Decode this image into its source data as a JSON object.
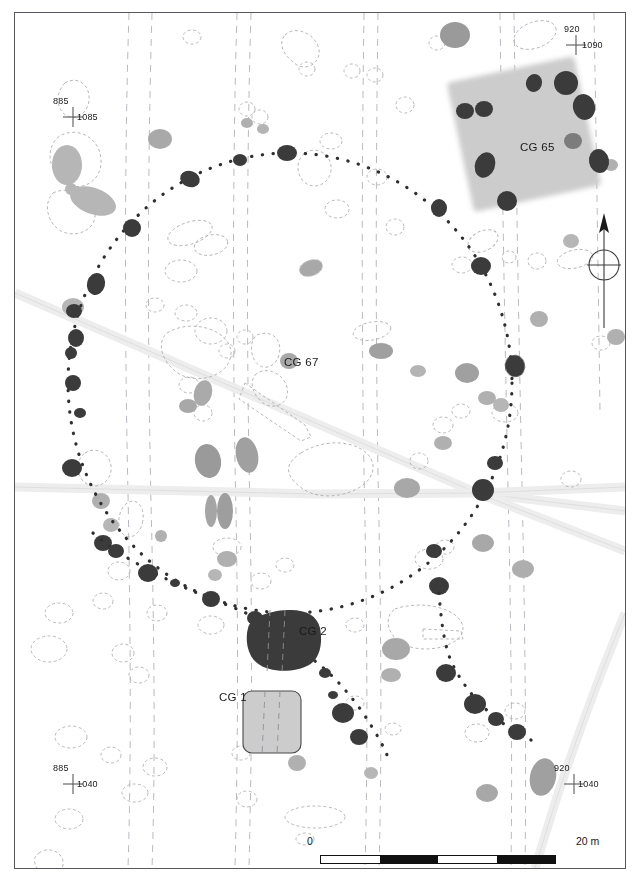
{
  "figure": {
    "type": "archaeological-site-plan",
    "background_color": "#ffffff",
    "border_color": "#58585c"
  },
  "site_labels": [
    {
      "id": "cg65",
      "text": "CG 65",
      "x": 519,
      "y": 135
    },
    {
      "id": "cg67",
      "text": "CG 67",
      "x": 283,
      "y": 350
    },
    {
      "id": "cg2",
      "text": "CG 2",
      "x": 298,
      "y": 626
    },
    {
      "id": "cg1",
      "text": "CG 1",
      "x": 218,
      "y": 692
    }
  ],
  "grid_markers": [
    {
      "id": "nw",
      "northing": "885",
      "easting": "1085",
      "x": 70,
      "y": 110
    },
    {
      "id": "ne",
      "northing": "920",
      "easting": "1090",
      "x": 575,
      "y": 38
    },
    {
      "id": "sw",
      "northing": "885",
      "easting": "1040",
      "x": 70,
      "y": 777
    },
    {
      "id": "se",
      "northing": "920",
      "easting": "1040",
      "x": 573,
      "y": 777
    }
  ],
  "scale_bar": {
    "start_label": "0",
    "end_label": "20 m",
    "segments": [
      "white",
      "black",
      "white",
      "black"
    ],
    "length_meters": 20
  },
  "north_arrow": {
    "name": "north-arrow",
    "direction": "up",
    "center_x": 603,
    "center_y": 264
  },
  "colors": {
    "posthole_dark": "#3b3b3b",
    "feature_mid_gray": "#8e8e8e",
    "feature_light_gray": "#b6b6b6",
    "structure_fill": "#cccccc",
    "road_fill": "#ededed",
    "road_edge": "#c8c8c8",
    "furrow_dash": "#b9b9c2",
    "outline_dash": "#b0b0b0",
    "text": "#1a1a1a"
  },
  "structures": {
    "cg65": {
      "name": "rotated-square-enclosure",
      "fill": "#cccccc",
      "rotation_deg": -12,
      "blurred": true
    },
    "cg2": {
      "name": "dark-pit-structure",
      "fill": "#3b3b3b"
    },
    "cg1": {
      "name": "light-pit-structure",
      "fill": "#cccccc",
      "stroke": "#4a4a4a"
    }
  },
  "legend_note": {
    "enclosure_ring": "dotted posthole ring",
    "furrows": "dashed plough furrow pairs",
    "roads": "light gray bands"
  }
}
